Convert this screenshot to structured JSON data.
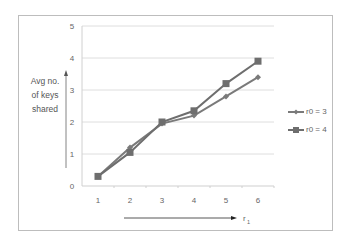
{
  "chart_data": {
    "type": "line",
    "title": "",
    "xlabel": "r1",
    "ylabel": "Avg no. of keys shared",
    "ylabel_lines": [
      "Avg no.",
      "of keys",
      "shared"
    ],
    "x": [
      1,
      2,
      3,
      4,
      5,
      6
    ],
    "categories": [
      "1",
      "2",
      "3",
      "4",
      "5",
      "6"
    ],
    "yticks": [
      "0",
      "1",
      "2",
      "3",
      "4",
      "5"
    ],
    "ylim": [
      0,
      5
    ],
    "grid": true,
    "legend_position": "right",
    "series": [
      {
        "name": "r0 = 3",
        "marker": "diamond",
        "color": "#7a7a7a",
        "values": [
          0.3,
          1.2,
          1.95,
          2.2,
          2.8,
          3.4
        ]
      },
      {
        "name": "r0 = 4",
        "marker": "square",
        "color": "#6e6e6e",
        "values": [
          0.3,
          1.05,
          2.0,
          2.35,
          3.2,
          3.9
        ]
      }
    ]
  },
  "axis": {
    "x_label": "r",
    "x_label_sub": "1"
  },
  "legend": {
    "items": [
      {
        "label": "r0 = 3"
      },
      {
        "label": "r0 = 4"
      }
    ]
  }
}
